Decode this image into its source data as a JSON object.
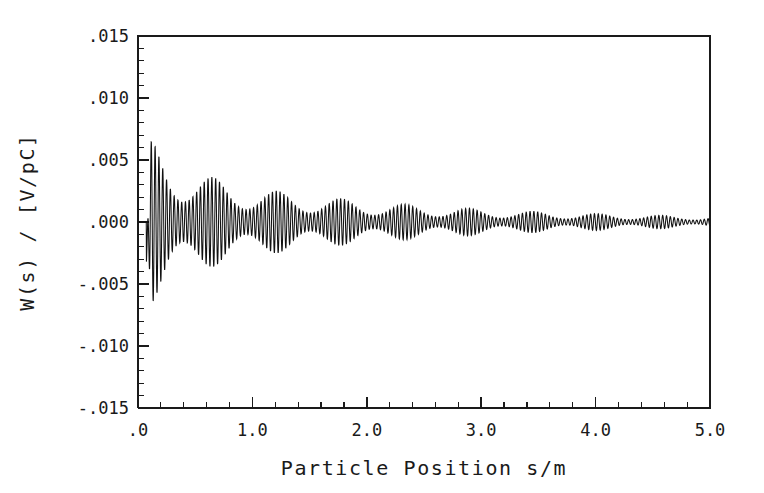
{
  "chart_data": {
    "type": "line",
    "title": "",
    "xlabel": "Particle Position s/m",
    "ylabel": "W(s) / [V/pC]",
    "xlim": [
      0.0,
      5.0
    ],
    "ylim": [
      -0.015,
      0.015
    ],
    "grid": false,
    "legend": null,
    "x_ticks": [
      {
        "value": 0.0,
        "label": ".0"
      },
      {
        "value": 1.0,
        "label": "1.0"
      },
      {
        "value": 2.0,
        "label": "2.0"
      },
      {
        "value": 3.0,
        "label": "3.0"
      },
      {
        "value": 4.0,
        "label": "4.0"
      },
      {
        "value": 5.0,
        "label": "5.0"
      }
    ],
    "y_ticks": [
      {
        "value": 0.015,
        "label": ".015"
      },
      {
        "value": 0.01,
        "label": ".010"
      },
      {
        "value": 0.005,
        "label": ".005"
      },
      {
        "value": 0.0,
        "label": ".000"
      },
      {
        "value": -0.005,
        "label": "-.005"
      },
      {
        "value": -0.01,
        "label": "-.010"
      },
      {
        "value": -0.015,
        "label": "-.015"
      }
    ],
    "x_minor_ticks_per_major": 5,
    "y_minor_ticks_per_major": 5,
    "series": [
      {
        "name": "wake potential",
        "color": "#111111",
        "description": "Damped oscillatory longitudinal wake potential with beating envelope",
        "signal_onset_s": 0.075,
        "oscillation_frequency_per_m": 30.2,
        "secondary_frequency_per_m": 28.4,
        "beat_period_m": 0.56,
        "envelope_peak_value": 0.0083,
        "envelope_initial_negative": -0.007,
        "envelope_decay_length_m": 0.62,
        "envelope_floor_value": 0.00032,
        "tail_amplitude_at_5m": 0.0003,
        "sample_count": 3600,
        "envelope_samples": [
          {
            "s": 0.08,
            "pos": 0.0083,
            "neg": -0.007
          },
          {
            "s": 0.15,
            "pos": 0.0059,
            "neg": -0.006
          },
          {
            "s": 0.25,
            "pos": 0.0047,
            "neg": -0.0053
          },
          {
            "s": 0.4,
            "pos": 0.0042,
            "neg": -0.0048
          },
          {
            "s": 0.6,
            "pos": 0.004,
            "neg": -0.0045
          },
          {
            "s": 0.8,
            "pos": 0.0036,
            "neg": -0.004
          },
          {
            "s": 1.0,
            "pos": 0.0032,
            "neg": -0.0035
          },
          {
            "s": 1.25,
            "pos": 0.0027,
            "neg": -0.0029
          },
          {
            "s": 1.5,
            "pos": 0.0022,
            "neg": -0.0024
          },
          {
            "s": 1.75,
            "pos": 0.0016,
            "neg": -0.0018
          },
          {
            "s": 2.0,
            "pos": 0.0012,
            "neg": -0.0013
          },
          {
            "s": 2.5,
            "pos": 0.0008,
            "neg": -0.0009
          },
          {
            "s": 3.0,
            "pos": 0.0006,
            "neg": -0.0006
          },
          {
            "s": 3.5,
            "pos": 0.0005,
            "neg": -0.0005
          },
          {
            "s": 4.0,
            "pos": 0.0004,
            "neg": -0.0004
          },
          {
            "s": 4.5,
            "pos": 0.00035,
            "neg": -0.00035
          },
          {
            "s": 5.0,
            "pos": 0.0003,
            "neg": -0.0003
          }
        ]
      }
    ]
  }
}
